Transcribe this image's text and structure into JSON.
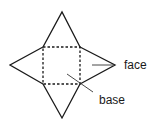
{
  "diagram": {
    "parts": [
      {
        "name": "base",
        "shape": "square",
        "style": "dashed"
      },
      {
        "name": "face-top",
        "shape": "triangle",
        "style": "solid"
      },
      {
        "name": "face-right",
        "shape": "triangle",
        "style": "solid"
      },
      {
        "name": "face-bottom",
        "shape": "triangle",
        "style": "solid"
      },
      {
        "name": "face-left",
        "shape": "triangle",
        "style": "solid"
      }
    ],
    "labels": {
      "face": "face",
      "base": "base"
    },
    "colors": {
      "line": "#1a1a1a",
      "background": "#ffffff"
    }
  }
}
